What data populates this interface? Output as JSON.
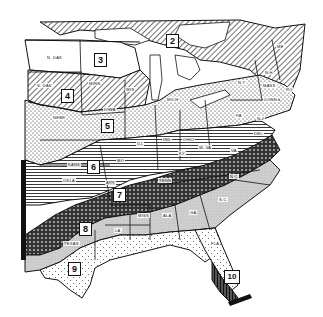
{
  "map": {
    "title": "Eastern United States zone map",
    "style": "black-and-white hatched regions",
    "zones": [
      {
        "id": "zone-2",
        "number": "2",
        "pattern": "diagonal-hatch"
      },
      {
        "id": "zone-3",
        "number": "3",
        "pattern": "white"
      },
      {
        "id": "zone-4",
        "number": "4",
        "pattern": "diagonal-hatch"
      },
      {
        "id": "zone-5",
        "number": "5",
        "pattern": "dots"
      },
      {
        "id": "zone-6",
        "number": "6",
        "pattern": "horizontal-lines"
      },
      {
        "id": "zone-7",
        "number": "7",
        "pattern": "crosshatch-dark"
      },
      {
        "id": "zone-8",
        "number": "8",
        "pattern": "light-gray-stipple"
      },
      {
        "id": "zone-9",
        "number": "9",
        "pattern": "sparse-dots"
      },
      {
        "id": "zone-10",
        "number": "10",
        "pattern": "vertical-lines-dark"
      }
    ],
    "state_labels": [
      "N. DAK",
      "S. DAK",
      "NEBR",
      "MINN",
      "WIS",
      "IOWA",
      "KANS",
      "OKLA",
      "TEXAS",
      "MO",
      "ARK",
      "LA",
      "ILL",
      "IND",
      "OHIO",
      "MICH",
      "KY",
      "W. VA",
      "VA",
      "TENN",
      "MISS",
      "ALA",
      "GA",
      "S.C",
      "N.C",
      "FLA",
      "PA",
      "N.Y",
      "N.H",
      "ME",
      "MASS",
      "R.I",
      "CONN",
      "DEL",
      "N.J"
    ]
  },
  "labels": {
    "ndak": "N. DAK",
    "sdak": "S. DAK",
    "nebr": "NEBR",
    "minn": "MINN",
    "wis": "WIS",
    "iowa": "IOWA",
    "kans": "KANS",
    "okla": "OKLA",
    "texas": "TEXAS",
    "mo": "MO",
    "ark": "ARK",
    "la": "LA",
    "ill": "ILL",
    "ind": "IND",
    "ohio": "OHIO",
    "mich": "MICH",
    "ky": "KY",
    "wva": "W. VA",
    "va": "VA",
    "tenn": "TENN",
    "miss": "MISS",
    "ala": "ALA",
    "ga": "GA",
    "sc": "S.C",
    "nc": "N.C",
    "fla": "FLA",
    "pa": "PA",
    "ny": "N.Y",
    "nh": "N.H",
    "me": "ME",
    "mass": "MASS",
    "ri": "R.I",
    "conn": "CONN",
    "del": "DEL",
    "nj": "N.J"
  },
  "zone_numbers": {
    "z2": "2",
    "z3": "3",
    "z4": "4",
    "z5": "5",
    "z6": "6",
    "z7": "7",
    "z8": "8",
    "z9": "9",
    "z10": "10"
  }
}
